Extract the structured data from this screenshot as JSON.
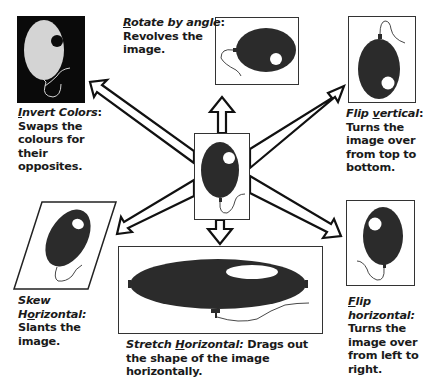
{
  "diagram": {
    "center": {
      "label": "Original image",
      "icon": "balloon-icon"
    },
    "transforms": [
      {
        "id": "invert-colors",
        "title_pre": "",
        "title_u": "I",
        "title_post": "nvert Colors",
        "sep": ":",
        "desc": "Swaps the colours for their opposites.",
        "lines": [
          "Swaps the",
          "colours for",
          "their",
          "opposites."
        ]
      },
      {
        "id": "rotate-by-angle",
        "title_pre": "",
        "title_u": "R",
        "title_post": "otate by angle",
        "sep": ":",
        "lines": [
          "Revolves the",
          "image."
        ]
      },
      {
        "id": "flip-vertical",
        "title_pre": "Flip ",
        "title_u": "v",
        "title_post": "ertical",
        "sep": ":",
        "lines": [
          "Turns the",
          "image over",
          "from top to",
          "bottom."
        ]
      },
      {
        "id": "skew-horizontal",
        "title_line1": "Skew",
        "title_pre": "H",
        "title_u": "o",
        "title_post": "rizontal:",
        "lines": [
          "Slants the",
          "image."
        ]
      },
      {
        "id": "stretch-horizontal",
        "title_pre": "Stretch ",
        "title_u": "H",
        "title_post": "orizontal:",
        "inline": " Drags out",
        "lines": [
          "the shape of the image",
          "horizontally."
        ]
      },
      {
        "id": "flip-horizontal",
        "title_u": "F",
        "title_post": "lip",
        "title_line2": "horizontal:",
        "lines": [
          "Turns the",
          "image over",
          "from left to",
          "right."
        ]
      }
    ]
  },
  "colors": {
    "balloon": "#2b2b2b",
    "ink": "#111111",
    "inverted_bg": "#0a0a0a",
    "inverted_balloon": "#d4d4d4",
    "paper": "#ffffff"
  }
}
